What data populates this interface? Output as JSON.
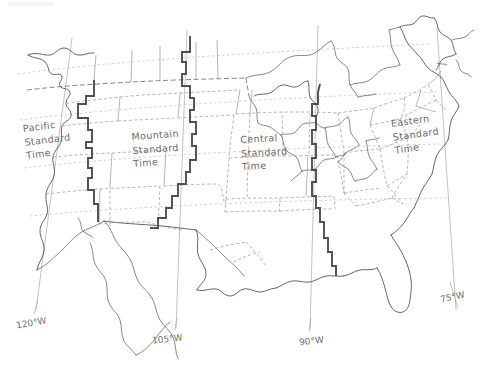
{
  "map": {
    "title": "United States Time Zones",
    "projection": "conic",
    "colors": {
      "background": "#ffffff",
      "coastline": "#4a4a4a",
      "state_border": "#8d8d8d",
      "national_border": "#5c5c5c",
      "timezone_boundary": "#5a5a5a",
      "meridian": "#a8a8a8",
      "parallel": "#b0b0b0",
      "label_text": "#6a6a6a"
    },
    "timezones": [
      {
        "id": "pacific",
        "name": "Pacific Standard Time",
        "lines": [
          "Pacific",
          "Standard",
          "Time"
        ],
        "x": 22,
        "y": 122,
        "rotate": -7
      },
      {
        "id": "mountain",
        "name": "Mountain Standard Time",
        "lines": [
          "Mountain",
          "Standard",
          "Time"
        ],
        "x": 131,
        "y": 130,
        "rotate": -4
      },
      {
        "id": "central",
        "name": "Central Standard Time",
        "lines": [
          "Central",
          "Standard",
          "Time"
        ],
        "x": 240,
        "y": 133,
        "rotate": -3
      },
      {
        "id": "eastern",
        "name": "Eastern Standard Time",
        "lines": [
          "Eastern",
          "Standard",
          "Time"
        ],
        "x": 390,
        "y": 117,
        "rotate": -8
      }
    ],
    "meridians": [
      {
        "id": "m120",
        "label": "120°W",
        "label_x": 16,
        "label_y": 318,
        "label_rotate": -10,
        "x_top": 72,
        "x_bottom": 36
      },
      {
        "id": "m105",
        "label": "105°W",
        "label_x": 152,
        "label_y": 334,
        "label_rotate": -6,
        "x_top": 187,
        "x_bottom": 176
      },
      {
        "id": "m90",
        "label": "90°W",
        "label_x": 299,
        "label_y": 336,
        "label_rotate": -6,
        "x_top": 318,
        "x_bottom": 310
      },
      {
        "id": "m75",
        "label": "75°W",
        "label_x": 440,
        "label_y": 292,
        "label_rotate": -12,
        "x_top": 437,
        "x_bottom": 455
      }
    ]
  }
}
